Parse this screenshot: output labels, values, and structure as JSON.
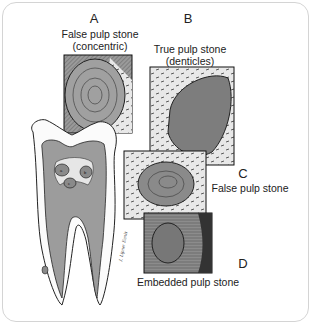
{
  "figure": {
    "type": "anatomical illustration of tooth with pulp stones",
    "panels": [
      {
        "letter": "A",
        "caption_line1": "False pulp stone",
        "caption_line2": "(concentric)"
      },
      {
        "letter": "B",
        "caption_line1": "True pulp stone",
        "caption_line2": "(denticles)"
      },
      {
        "letter": "C",
        "caption_line1": "False pulp stone"
      },
      {
        "letter": "D",
        "caption_line1": "Embedded pulp stone"
      }
    ],
    "tooth_markers": [
      "a",
      "b",
      "c",
      "d"
    ],
    "signature": "J. Lipner Ennis",
    "colors": {
      "stone": "#8a8a8a",
      "dentin": "#a3a3a3",
      "background": "#ffffff",
      "line": "#1a1a1a"
    }
  }
}
